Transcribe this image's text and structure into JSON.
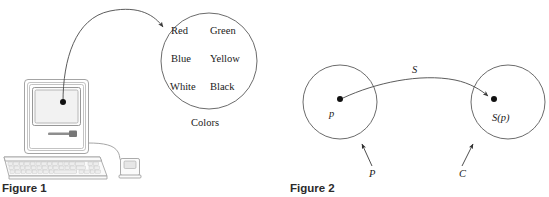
{
  "page": {
    "background_color": "#ffffff",
    "width": 549,
    "height": 197
  },
  "figure1": {
    "caption": "Figure 1",
    "computer": {
      "name": "desktop-computer-illustration",
      "parts": [
        "case",
        "screen",
        "floppy-slot",
        "keyboard",
        "mouse",
        "cable"
      ]
    },
    "arrow": {
      "name": "mapping-arrow",
      "from": "screen-point",
      "to": "colors-set"
    },
    "set": {
      "label": "Colors",
      "items": [
        "Red",
        "Green",
        "Blue",
        "Yellow",
        "White",
        "Black"
      ],
      "rows": [
        [
          "Red",
          "Green"
        ],
        [
          "Blue",
          "Yellow"
        ],
        [
          "White",
          "Black"
        ]
      ]
    }
  },
  "figure2": {
    "caption": "Figure 2",
    "source_set": {
      "set_label": "P",
      "element_label": "p"
    },
    "target_set": {
      "set_label": "C",
      "element_label": "S(p)"
    },
    "mapping": {
      "label": "S"
    }
  },
  "colors": {
    "stroke": "#5a5a5a",
    "text": "#1a1a1a",
    "caption": "#2b2b2b",
    "case_outline": "#9a9a9a",
    "screen_face": "#f2f2f2"
  }
}
